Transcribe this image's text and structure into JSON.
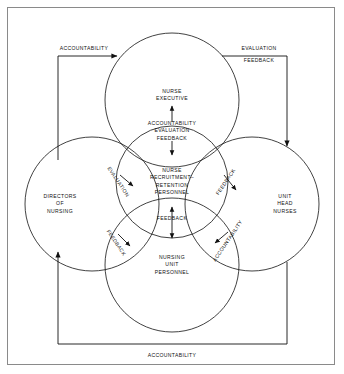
{
  "diagram": {
    "stroke_color": "#111111",
    "frame_color": "#8a8a8a",
    "background": "#ffffff",
    "circles": [
      {
        "id": "nurse-executive",
        "label": "NURSE\nEXECUTIVE",
        "label_line1": "NURSE",
        "label_line2": "EXECUTIVE",
        "cx": 172,
        "cy": 100,
        "r": 67
      },
      {
        "id": "directors-of-nursing",
        "label_line1": "DIRECTORS",
        "label_line2": "OF",
        "label_line3": "NURSING",
        "cx": 92,
        "cy": 204,
        "r": 67
      },
      {
        "id": "unit-head-nurses",
        "label_line1": "UNIT",
        "label_line2": "HEAD",
        "label_line3": "NURSES",
        "cx": 252,
        "cy": 204,
        "r": 67
      },
      {
        "id": "nursing-unit-personnel",
        "label_line1": "NURSING",
        "label_line2": "UNIT",
        "label_line3": "PERSONNEL",
        "cx": 172,
        "cy": 265,
        "r": 67
      },
      {
        "id": "nurse-recruitment-retention-personnel",
        "label_line1": "NURSE",
        "label_line2": "RECRUITMENT–",
        "label_line3": "RETENTION",
        "label_line4": "PERSONNEL",
        "cx": 172,
        "cy": 182,
        "r": 56
      }
    ],
    "overlap_labels": [
      {
        "id": "top-lens",
        "lines": [
          "ACCOUNTABILITY",
          "EVALUATION",
          "FEEDBACK"
        ],
        "x": 172,
        "y": 130,
        "arrows": "double-vertical"
      },
      {
        "id": "center-lens",
        "lines": [
          "FEEDBACK"
        ],
        "x": 172,
        "y": 218,
        "arrows": "double-vertical"
      },
      {
        "id": "upper-left-lens",
        "lines": [
          "EVALUATION"
        ],
        "x": 120,
        "y": 180,
        "arrows": "single"
      },
      {
        "id": "upper-right-lens",
        "lines": [
          "FEEDBACK"
        ],
        "x": 224,
        "y": 180,
        "arrows": "single"
      },
      {
        "id": "lower-left-lens",
        "lines": [
          "FEEDBACK"
        ],
        "x": 120,
        "y": 240,
        "arrows": "single"
      },
      {
        "id": "lower-right-lens",
        "lines": [
          "ACCOUNTABILITY"
        ],
        "x": 224,
        "y": 240,
        "arrows": "single"
      }
    ],
    "flow_labels": [
      {
        "id": "left-accountability",
        "text": "ACCOUNTABILITY",
        "x": 84,
        "y": 53
      },
      {
        "id": "right-evaluation",
        "text": "EVALUATION",
        "x": 258,
        "y": 52
      },
      {
        "id": "right-feedback",
        "text": "FEEDBACK",
        "x": 257,
        "y": 63
      },
      {
        "id": "bottom-accountability",
        "text": "ACCOUNTABILITY",
        "x": 172,
        "y": 356
      }
    ]
  }
}
